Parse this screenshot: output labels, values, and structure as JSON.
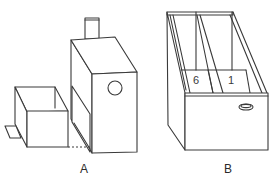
{
  "figure": {
    "panels": [
      {
        "id": "A",
        "label": "A",
        "description": "Tall box with chimney, round hole on front, and a pull-out drawer box with tab"
      },
      {
        "id": "B",
        "label": "B",
        "description": "Open tray divided into two compartments with oval handle hole",
        "compartments": [
          "6",
          "1"
        ]
      }
    ],
    "colors": {
      "line": "#3a3a3a",
      "background": "#ffffff"
    }
  }
}
